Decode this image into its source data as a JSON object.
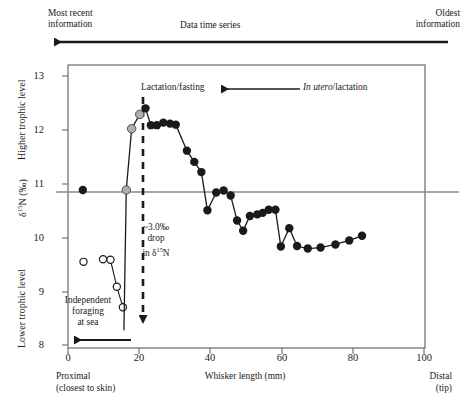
{
  "header": {
    "left_label": "Most recent\ninformation",
    "center_label": "Data time series",
    "right_label": "Oldest\ninformation",
    "arrow_name": "time-direction-arrow"
  },
  "axes": {
    "y_label_main": "δ¹⁵N (‰)",
    "y_label_top": "Higher trophic level",
    "y_label_bottom": "Lower trophic level",
    "y_ticks": [
      "8",
      "9",
      "10",
      "11",
      "12",
      "13"
    ],
    "x_label": "Whisker length (mm)",
    "x_ticks": [
      "0",
      "20",
      "40",
      "60",
      "80",
      "100"
    ],
    "x_left_caption": "Proximal\n(closest to skin)",
    "x_right_caption": "Distal\n(tip)"
  },
  "annotations": {
    "lactation_fasting": "Lactation/fasting",
    "in_utero_italic": "In utero",
    "in_utero_rest": "/lactation",
    "drop_note": "~3.0‰\ndrop\nin δ¹⁵N",
    "independent_foraging": "Independent\nforaging\nat sea"
  },
  "colors": {
    "filled_marker": "#1a1a1a",
    "gray_marker": "#b0b0b0",
    "open_marker": "#ffffff",
    "reference_line": "#8a8a8a",
    "axis": "#555555",
    "dashed_arrow": "#1a1a1a"
  },
  "chart_data": {
    "type": "line",
    "title": "",
    "xlabel": "Whisker length (mm)",
    "ylabel": "δ¹⁵N (‰)",
    "xlim": [
      -2,
      104
    ],
    "ylim": [
      7.75,
      13.3
    ],
    "grid": false,
    "legend": "none",
    "reference_line_y": 10.85,
    "series": [
      {
        "name": "Independent foraging at sea (open circles)",
        "marker": "open-circle",
        "connected": false,
        "points": [
          {
            "x": 2.6,
            "y": 9.44
          }
        ]
      },
      {
        "name": "Independent foraging at sea (open circles, connected)",
        "marker": "open-circle",
        "connected": true,
        "points": [
          {
            "x": 8.4,
            "y": 9.49
          },
          {
            "x": 10.6,
            "y": 9.48
          },
          {
            "x": 12.5,
            "y": 8.95
          },
          {
            "x": 14.3,
            "y": 8.55
          }
        ]
      },
      {
        "name": "Isolated proximal point (filled)",
        "marker": "filled-circle",
        "connected": false,
        "points": [
          {
            "x": 2.4,
            "y": 10.85
          }
        ]
      },
      {
        "name": "Whisker δ¹⁵N profile",
        "marker": "mixed",
        "connected": true,
        "points": [
          {
            "x": 14.6,
            "y": 8.1,
            "marker": "none"
          },
          {
            "x": 15.3,
            "y": 10.85,
            "marker": "gray-circle"
          },
          {
            "x": 16.9,
            "y": 12.05,
            "marker": "gray-circle"
          },
          {
            "x": 19.3,
            "y": 12.33,
            "marker": "gray-circle"
          },
          {
            "x": 21.0,
            "y": 12.45,
            "marker": "filled-circle"
          },
          {
            "x": 22.6,
            "y": 12.12,
            "marker": "filled-circle"
          },
          {
            "x": 24.4,
            "y": 12.12,
            "marker": "filled-circle"
          },
          {
            "x": 26.3,
            "y": 12.17,
            "marker": "filled-circle"
          },
          {
            "x": 28.3,
            "y": 12.15,
            "marker": "filled-circle"
          },
          {
            "x": 30.0,
            "y": 12.13,
            "marker": "filled-circle"
          },
          {
            "x": 33.3,
            "y": 11.62,
            "marker": "filled-circle"
          },
          {
            "x": 35.5,
            "y": 11.4,
            "marker": "filled-circle"
          },
          {
            "x": 37.6,
            "y": 11.2,
            "marker": "filled-circle"
          },
          {
            "x": 39.4,
            "y": 10.45,
            "marker": "filled-circle"
          },
          {
            "x": 42.0,
            "y": 10.8,
            "marker": "filled-circle"
          },
          {
            "x": 44.2,
            "y": 10.84,
            "marker": "filled-circle"
          },
          {
            "x": 46.3,
            "y": 10.74,
            "marker": "filled-circle"
          },
          {
            "x": 48.2,
            "y": 10.25,
            "marker": "filled-circle"
          },
          {
            "x": 50.0,
            "y": 10.05,
            "marker": "filled-circle"
          },
          {
            "x": 52.0,
            "y": 10.34,
            "marker": "filled-circle"
          },
          {
            "x": 54.2,
            "y": 10.37,
            "marker": "filled-circle"
          },
          {
            "x": 55.8,
            "y": 10.4,
            "marker": "filled-circle"
          },
          {
            "x": 57.6,
            "y": 10.46,
            "marker": "filled-circle"
          },
          {
            "x": 59.6,
            "y": 10.46,
            "marker": "filled-circle"
          },
          {
            "x": 61.2,
            "y": 9.74,
            "marker": "filled-circle"
          },
          {
            "x": 63.7,
            "y": 10.1,
            "marker": "filled-circle"
          },
          {
            "x": 66.0,
            "y": 9.75,
            "marker": "filled-circle"
          },
          {
            "x": 69.2,
            "y": 9.7,
            "marker": "filled-circle"
          },
          {
            "x": 73.0,
            "y": 9.72,
            "marker": "filled-circle"
          },
          {
            "x": 77.4,
            "y": 9.78,
            "marker": "filled-circle"
          },
          {
            "x": 81.5,
            "y": 9.86,
            "marker": "filled-circle"
          },
          {
            "x": 85.3,
            "y": 9.95,
            "marker": "filled-circle"
          }
        ]
      }
    ]
  }
}
